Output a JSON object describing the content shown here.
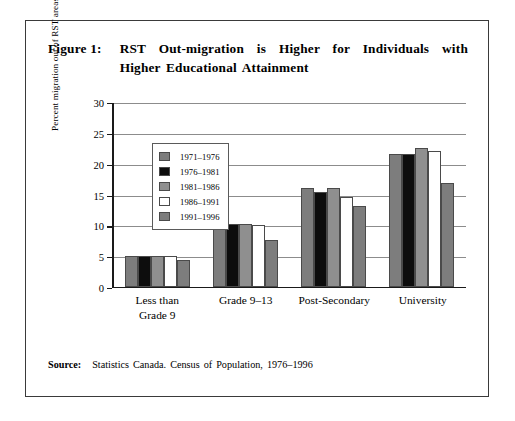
{
  "figure": {
    "label": "Figure 1:",
    "title_line1": "RST Out-migration is Higher for Individuals with",
    "title_line2": "Higher Educational Attainment"
  },
  "source": {
    "label": "Source:",
    "text": "Statistics Canada. Census of Population, 1976–1996"
  },
  "chart_data": {
    "type": "bar",
    "title": "RST Out-migration is Higher for Individuals with Higher Educational Attainment",
    "xlabel": "",
    "ylabel": "Percent migration out of RST areas",
    "ylim": [
      0,
      30
    ],
    "yticks": [
      0,
      5,
      10,
      15,
      20,
      25,
      30
    ],
    "ytick_labels": [
      "0",
      "5",
      "10",
      "15",
      "20",
      "25",
      "30"
    ],
    "grid": true,
    "legend_position": "upper-left-inside",
    "categories": [
      "Less than Grade 9",
      "Grade 9–13",
      "Post-Secondary",
      "University"
    ],
    "category_lines": [
      [
        "Less than",
        "Grade 9"
      ],
      [
        "Grade 9–13"
      ],
      [
        "Post-Secondary"
      ],
      [
        "University"
      ]
    ],
    "series": [
      {
        "name": "1971–1976",
        "color": "#7d7d7d",
        "values": [
          5.0,
          10.1,
          16.0,
          21.5
        ]
      },
      {
        "name": "1976–1981",
        "color": "#0d0d0d",
        "values": [
          5.0,
          10.2,
          15.3,
          21.5
        ]
      },
      {
        "name": "1981–1986",
        "color": "#8f8f8f",
        "values": [
          5.0,
          10.1,
          16.0,
          22.5
        ]
      },
      {
        "name": "1986–1991",
        "color": "#ffffff",
        "values": [
          5.0,
          9.9,
          14.5,
          22.0
        ]
      },
      {
        "name": "1991–1996",
        "color": "#7d7d7d",
        "values": [
          4.3,
          7.5,
          13.0,
          16.8
        ]
      }
    ]
  }
}
